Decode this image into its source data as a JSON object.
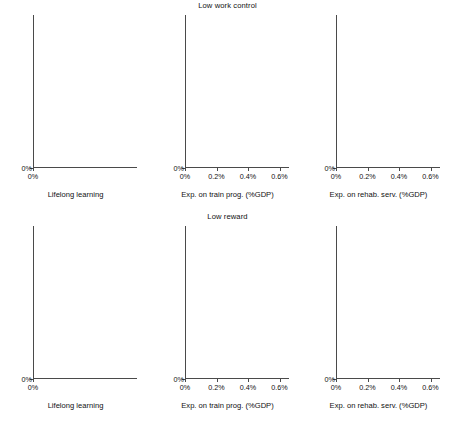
{
  "figure": {
    "width": 455,
    "height": 421,
    "line_color": "#e8703a",
    "grid_color": "#9b9b9b",
    "dot_color": "#1a1a1a"
  },
  "chart_data": [
    {
      "id": "panel-tl",
      "type": "scatter",
      "title": "",
      "xlabel": "Lifelong learning",
      "ylabel": "",
      "xlim": [
        0,
        0.33
      ],
      "ylim": [
        0,
        0.35
      ],
      "xticks": [
        0,
        10,
        20,
        30
      ],
      "xtick_labels": [
        "0%",
        "10%",
        "20%",
        "30%"
      ],
      "yticks": [
        0,
        10,
        20,
        30
      ],
      "ytick_labels": [
        "0%",
        "10%",
        "20%",
        "30%"
      ],
      "grid": true,
      "r2_label": "R² = 0.41",
      "r2_value": 0.41,
      "fit_line": {
        "x0": 1.0,
        "y0": 24.4,
        "x1": 30.0,
        "y1": 10.2
      },
      "points": [
        {
          "label": "GR",
          "x": 1.2,
          "y": 33.2,
          "lx": 4,
          "ly": 8
        },
        {
          "label": "IT",
          "x": 4.5,
          "y": 31.5,
          "lx": 4,
          "ly": 4
        },
        {
          "label": "PL",
          "x": 4.7,
          "y": 28.3,
          "lx": 4,
          "ly": 3
        },
        {
          "label": "ES",
          "x": 5.4,
          "y": 23.9,
          "lx": 4,
          "ly": 3
        },
        {
          "label": "BE",
          "x": 5.7,
          "y": 20.2,
          "lx": 4,
          "ly": 3
        },
        {
          "label": "AT",
          "x": 8.5,
          "y": 19.2,
          "lx": 4,
          "ly": 3
        },
        {
          "label": "FR",
          "x": 4.4,
          "y": 18.8,
          "lx": 4,
          "ly": 3
        },
        {
          "label": "CZ",
          "x": 5.0,
          "y": 16.3,
          "lx": 4,
          "ly": 3
        },
        {
          "label": "DE",
          "x": 5.5,
          "y": 14.8,
          "lx": 4,
          "ly": 3
        },
        {
          "label": "NL",
          "x": 14.0,
          "y": 11.3,
          "lx": 4,
          "ly": 3
        },
        {
          "label": "DK",
          "x": 23.3,
          "y": 11.5,
          "lx": 4,
          "ly": 3
        },
        {
          "label": "SE",
          "x": 29.0,
          "y": 12.3,
          "lx": 4,
          "ly": 3
        },
        {
          "label": "CH",
          "x": 28.6,
          "y": 16.1,
          "lx": 4,
          "ly": 3
        }
      ]
    },
    {
      "id": "panel-tm",
      "type": "scatter",
      "title": "Low work control",
      "xlabel": "Exp. on train prog. (%GDP)",
      "ylabel": "",
      "xlim": [
        0,
        0.66
      ],
      "ylim": [
        0,
        0.35
      ],
      "xticks": [
        0,
        0.2,
        0.4,
        0.6
      ],
      "xtick_labels": [
        "0%",
        "0.2%",
        "0.4%",
        "0.6%"
      ],
      "yticks": [
        0,
        10,
        20,
        30
      ],
      "ytick_labels": [
        "0%",
        "10%",
        "20%",
        "30%"
      ],
      "grid": true,
      "r2_label": "R² = 0.28",
      "r2_value": 0.28,
      "fit_line": {
        "x0": 0.0,
        "y0": 24.5,
        "x1": 0.64,
        "y1": 11.4
      },
      "points": [
        {
          "label": "GR",
          "x": 0.075,
          "y": 33.1,
          "lx": 4,
          "ly": 8
        },
        {
          "label": "IT",
          "x": 0.185,
          "y": 31.4,
          "lx": 4,
          "ly": 4
        },
        {
          "label": "PL",
          "x": 0.1,
          "y": 28.2,
          "lx": 4,
          "ly": 3
        },
        {
          "label": "ES",
          "x": 0.158,
          "y": 23.9,
          "lx": 4,
          "ly": 3
        },
        {
          "label": "BE",
          "x": 0.18,
          "y": 20.3,
          "lx": 4,
          "ly": 3
        },
        {
          "label": "AT",
          "x": 0.215,
          "y": 19.2,
          "lx": 4,
          "ly": 4
        },
        {
          "label": "FR",
          "x": 0.39,
          "y": 18.6,
          "lx": 4,
          "ly": 3
        },
        {
          "label": "CZ",
          "x": 0.01,
          "y": 16.4,
          "lx": 4,
          "ly": 4
        },
        {
          "label": "CH",
          "x": 0.175,
          "y": 16.1,
          "lx": 4,
          "ly": 3
        },
        {
          "label": "DE",
          "x": 0.4,
          "y": 14.3,
          "lx": 4,
          "ly": 3
        },
        {
          "label": "NL",
          "x": 0.18,
          "y": 11.3,
          "lx": 4,
          "ly": 3
        },
        {
          "label": "DK",
          "x": 0.53,
          "y": 11.8,
          "lx": 4,
          "ly": 3
        },
        {
          "label": "SE",
          "x": 0.625,
          "y": 12.3,
          "lx": 4,
          "ly": 3
        }
      ]
    },
    {
      "id": "panel-tr",
      "type": "scatter",
      "title": "",
      "xlabel": "Exp. on rehab. serv. (%GDP)",
      "ylabel": "",
      "xlim": [
        0,
        0.66
      ],
      "ylim": [
        0,
        0.35
      ],
      "xticks": [
        0,
        0.2,
        0.4,
        0.6
      ],
      "xtick_labels": [
        "0%",
        "0.2%",
        "0.4%",
        "0.6%"
      ],
      "yticks": [
        0,
        10,
        20,
        30
      ],
      "ytick_labels": [
        "0%",
        "10%",
        "20%",
        "30%"
      ],
      "grid": true,
      "r2_label": "R² = 0.39",
      "r2_value": 0.39,
      "fit_line": {
        "x0": 0.005,
        "y0": 22.7,
        "x1": 0.62,
        "y1": 7.2
      },
      "points": [
        {
          "label": "GR",
          "x": 0.005,
          "y": 33.2,
          "lx": 4,
          "ly": 4
        },
        {
          "label": "IT",
          "x": 0.003,
          "y": 31.3,
          "lx": 4,
          "ly": 4
        },
        {
          "label": "PL",
          "x": 0.075,
          "y": 28.2,
          "lx": -1,
          "ly": 7
        },
        {
          "label": "ES",
          "x": 0.008,
          "y": 23.6,
          "lx": 1,
          "ly": 8
        },
        {
          "label": "BE",
          "x": 0.085,
          "y": 20.4,
          "lx": 3,
          "ly": 6
        },
        {
          "label": "FR",
          "x": 0.035,
          "y": 18.7,
          "lx": 4,
          "ly": 6
        },
        {
          "label": "AT",
          "x": 0.01,
          "y": 18.8,
          "lx": -2,
          "ly": 7
        },
        {
          "label": "CH",
          "x": 0.13,
          "y": 16.2,
          "lx": 4,
          "ly": 3
        },
        {
          "label": "CZ",
          "x": 0.002,
          "y": 15.5,
          "lx": 3,
          "ly": 6
        },
        {
          "label": "DE",
          "x": 0.095,
          "y": 12.8,
          "lx": 0,
          "ly": 7
        },
        {
          "label": "DK",
          "x": 0.155,
          "y": 11.6,
          "lx": 0,
          "ly": 7
        },
        {
          "label": "SE",
          "x": 0.33,
          "y": 12.2,
          "lx": 0,
          "ly": 7
        },
        {
          "label": "NL",
          "x": 0.58,
          "y": 11.4,
          "lx": -14,
          "ly": 4
        }
      ]
    },
    {
      "id": "panel-bl",
      "type": "scatter",
      "title": "",
      "xlabel": "Lifelong learning",
      "ylabel": "",
      "xlim": [
        0,
        0.33
      ],
      "ylim": [
        0,
        0.35
      ],
      "xticks": [
        0,
        10,
        20,
        30
      ],
      "xtick_labels": [
        "0%",
        "10%",
        "20%",
        "30%"
      ],
      "yticks": [
        0,
        10,
        20,
        30
      ],
      "ytick_labels": [
        "0%",
        "10%",
        "20%",
        "30%"
      ],
      "grid": true,
      "r2_label": "R² = 0.55",
      "r2_value": 0.55,
      "fit_line": {
        "x0": 2.6,
        "y0": 25.6,
        "x1": 30.2,
        "y1": 8.3
      },
      "points": [
        {
          "label": "ES",
          "x": 5.7,
          "y": 31.4,
          "lx": 4,
          "ly": 3
        },
        {
          "label": "CZ",
          "x": 5.0,
          "y": 29.2,
          "lx": 4,
          "ly": 3
        },
        {
          "label": "IT",
          "x": 5.2,
          "y": 27.0,
          "lx": 4,
          "ly": 4
        },
        {
          "label": "GR",
          "x": 1.4,
          "y": 26.5,
          "lx": 3,
          "ly": 7
        },
        {
          "label": "FR",
          "x": 4.8,
          "y": 25.5,
          "lx": 4,
          "ly": 5
        },
        {
          "label": "PL",
          "x": 4.3,
          "y": 23.9,
          "lx": -1,
          "ly": 7
        },
        {
          "label": "BE",
          "x": 7.2,
          "y": 19.2,
          "lx": 4,
          "ly": 3
        },
        {
          "label": "AT",
          "x": 8.4,
          "y": 14.9,
          "lx": 4,
          "ly": 3
        },
        {
          "label": "DE",
          "x": 6.6,
          "y": 13.1,
          "lx": 4,
          "ly": 3
        },
        {
          "label": "NL",
          "x": 14.3,
          "y": 10.3,
          "lx": 4,
          "ly": 3
        },
        {
          "label": "DK",
          "x": 23.6,
          "y": 10.6,
          "lx": 4,
          "ly": 3
        },
        {
          "label": "SE",
          "x": 29.4,
          "y": 14.5,
          "lx": -15,
          "ly": 3
        },
        {
          "label": "CH",
          "x": 30.0,
          "y": 8.2,
          "lx": -4,
          "ly": 9
        }
      ]
    },
    {
      "id": "panel-bm",
      "type": "scatter",
      "title": "Low reward",
      "xlabel": "Exp. on train prog. (%GDP)",
      "ylabel": "",
      "xlim": [
        0,
        0.66
      ],
      "ylim": [
        0,
        0.35
      ],
      "xticks": [
        0,
        0.2,
        0.4,
        0.6
      ],
      "xtick_labels": [
        "0%",
        "0.2%",
        "0.4%",
        "0.6%"
      ],
      "yticks": [
        0,
        10,
        20,
        30
      ],
      "ytick_labels": [
        "0%",
        "10%",
        "20%",
        "30%"
      ],
      "grid": true,
      "r2_label": "R² = 0.23",
      "r2_value": 0.23,
      "fit_line": {
        "x0": 0.0,
        "y0": 24.1,
        "x1": 0.63,
        "y1": 11.8
      },
      "points": [
        {
          "label": "ES",
          "x": 0.155,
          "y": 31.3,
          "lx": 3,
          "ly": 5
        },
        {
          "label": "CZ",
          "x": 0.005,
          "y": 29.3,
          "lx": 4,
          "ly": 3
        },
        {
          "label": "GR",
          "x": 0.085,
          "y": 26.9,
          "lx": 4,
          "ly": 3
        },
        {
          "label": "IT",
          "x": 0.205,
          "y": 27.0,
          "lx": 4,
          "ly": 3
        },
        {
          "label": "FR",
          "x": 0.385,
          "y": 27.0,
          "lx": 4,
          "ly": 3
        },
        {
          "label": "PL",
          "x": 0.11,
          "y": 24.9,
          "lx": 4,
          "ly": 3
        },
        {
          "label": "BE",
          "x": 0.145,
          "y": 19.0,
          "lx": 4,
          "ly": 3
        },
        {
          "label": "AT",
          "x": 0.215,
          "y": 14.9,
          "lx": 4,
          "ly": 3
        },
        {
          "label": "DE",
          "x": 0.4,
          "y": 12.9,
          "lx": 4,
          "ly": 3
        },
        {
          "label": "SE",
          "x": 0.635,
          "y": 14.4,
          "lx": 4,
          "ly": 3
        },
        {
          "label": "NL",
          "x": 0.16,
          "y": 10.2,
          "lx": 4,
          "ly": 3
        },
        {
          "label": "DK",
          "x": 0.54,
          "y": 10.3,
          "lx": 4,
          "ly": 3
        },
        {
          "label": "CH",
          "x": 0.15,
          "y": 8.4,
          "lx": 4,
          "ly": 3
        }
      ]
    },
    {
      "id": "panel-br",
      "type": "scatter",
      "title": "",
      "xlabel": "Exp. on rehab. serv. (%GDP)",
      "ylabel": "",
      "xlim": [
        0,
        0.66
      ],
      "ylim": [
        0,
        0.35
      ],
      "xticks": [
        0,
        0.2,
        0.4,
        0.6
      ],
      "xtick_labels": [
        "0%",
        "0.2%",
        "0.4%",
        "0.6%"
      ],
      "yticks": [
        0,
        10,
        20,
        30
      ],
      "ytick_labels": [
        "0%",
        "10%",
        "20%",
        "30%"
      ],
      "grid": true,
      "r2_label": "R² = 0.43",
      "r2_value": 0.43,
      "fit_line": {
        "x0": 0.0,
        "y0": 24.1,
        "x1": 0.6,
        "y1": 4.6
      },
      "points": [
        {
          "label": "ES",
          "x": 0.008,
          "y": 31.4,
          "lx": 3,
          "ly": 5
        },
        {
          "label": "CZ",
          "x": 0.003,
          "y": 29.2,
          "lx": 3,
          "ly": 5
        },
        {
          "label": "IT",
          "x": 0.002,
          "y": 27.1,
          "lx": 3,
          "ly": 5
        },
        {
          "label": "FR",
          "x": 0.06,
          "y": 26.1,
          "lx": 3,
          "ly": 4
        },
        {
          "label": "GR",
          "x": 0.002,
          "y": 25.6,
          "lx": 1,
          "ly": 7
        },
        {
          "label": "PL",
          "x": 0.075,
          "y": 24.2,
          "lx": 0,
          "ly": 7
        },
        {
          "label": "BE",
          "x": 0.095,
          "y": 18.6,
          "lx": 2,
          "ly": 7
        },
        {
          "label": "AT",
          "x": 0.01,
          "y": 14.6,
          "lx": -1,
          "ly": 8
        },
        {
          "label": "DE",
          "x": 0.105,
          "y": 12.6,
          "lx": 1,
          "ly": 7
        },
        {
          "label": "SE",
          "x": 0.33,
          "y": 14.3,
          "lx": 1,
          "ly": 7
        },
        {
          "label": "DK",
          "x": 0.195,
          "y": 10.3,
          "lx": 4,
          "ly": 3
        },
        {
          "label": "NL",
          "x": 0.58,
          "y": 10.3,
          "lx": -14,
          "ly": 6
        },
        {
          "label": "CH",
          "x": 0.14,
          "y": 8.4,
          "lx": 4,
          "ly": 3
        }
      ]
    }
  ]
}
